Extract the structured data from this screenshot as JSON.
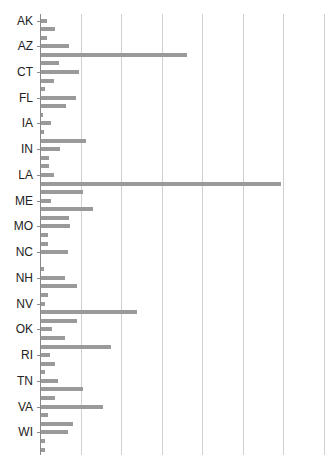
{
  "chart_data": {
    "type": "bar",
    "orientation": "horizontal",
    "title": "",
    "xlabel": "",
    "ylabel": "",
    "grid": true,
    "legend": null,
    "x_tick_labels_visible": false,
    "value_units_note": "values in relative units; 10 units = one gridline interval (no axis numbers shown)",
    "xlim": [
      0,
      70
    ],
    "gridlines_at": [
      10,
      20,
      30,
      40,
      50,
      60,
      70
    ],
    "visible_category_labels": [
      "AK",
      "AZ",
      "CT",
      "FL",
      "IA",
      "IN",
      "LA",
      "ME",
      "MO",
      "NC",
      "NH",
      "NV",
      "OK",
      "RI",
      "TN",
      "VA",
      "WI"
    ],
    "categories": [
      "AK",
      "AL",
      "AR",
      "AZ",
      "CA",
      "CO",
      "CT",
      "DC",
      "DE",
      "FL",
      "GA",
      "HI",
      "IA",
      "ID",
      "IL",
      "IN",
      "KS",
      "KY",
      "LA",
      "MA",
      "MD",
      "ME",
      "MI",
      "MN",
      "MO",
      "MS",
      "MT",
      "NC",
      "ND",
      "NE",
      "NH",
      "NJ",
      "NM",
      "NV",
      "NY",
      "OH",
      "OK",
      "OR",
      "PA",
      "RI",
      "SC",
      "SD",
      "TN",
      "TX",
      "UT",
      "VA",
      "VT",
      "WA",
      "WI",
      "WV",
      "WY"
    ],
    "values": [
      1.5,
      3.5,
      1.5,
      7.0,
      36.0,
      4.5,
      9.5,
      3.2,
      1.0,
      8.6,
      6.2,
      0.5,
      2.5,
      0.8,
      11.1,
      4.7,
      2.0,
      2.0,
      3.2,
      59.3,
      10.4,
      2.5,
      12.8,
      6.9,
      7.2,
      1.7,
      1.7,
      6.7,
      0,
      0.8,
      5.9,
      8.9,
      1.7,
      1.0,
      23.7,
      8.9,
      2.7,
      5.9,
      17.3,
      2.2,
      3.5,
      1.0,
      4.2,
      10.4,
      3.5,
      15.3,
      1.7,
      7.9,
      6.7,
      1.0,
      1.0
    ],
    "bar_color": "#9a9a9a",
    "grid_color": "#d0d0d0"
  }
}
